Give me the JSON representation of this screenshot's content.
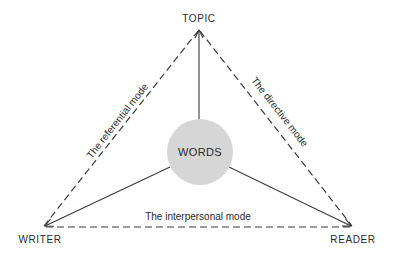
{
  "diagram": {
    "vertices": {
      "topic": "TOPIC",
      "writer": "WRITER",
      "reader": "READER"
    },
    "center": "WORDS",
    "modes": {
      "referential": "The referential mode",
      "directive": "The directive mode",
      "interpersonal": "The interpersonal mode"
    },
    "colors": {
      "line": "#3a3a3a",
      "circle_fill": "#d6d6d6",
      "text": "#2a2a2a",
      "background": "#ffffff"
    }
  }
}
